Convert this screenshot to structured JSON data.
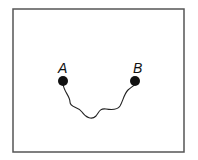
{
  "diagram": {
    "frame": {
      "x": 13,
      "y": 9,
      "width": 171,
      "height": 143,
      "stroke": "#555555"
    },
    "points": [
      {
        "label": "A",
        "cx": 63,
        "cy": 81,
        "r": 5,
        "label_x": 58,
        "label_y": 73
      },
      {
        "label": "B",
        "cx": 135,
        "cy": 81,
        "r": 5,
        "label_x": 133,
        "label_y": 73
      }
    ],
    "path": {
      "from": "A",
      "to": "B",
      "style": "wavy",
      "d": "M63,84 C64,92 70,96 70,102 C70,108 78,106 82,112 C86,118 92,120 96,116 C99,112 100,108 106,109 C112,110 118,109 120,106 C123,101 124,94 128,90 C131,87 134,86 135,84"
    }
  }
}
